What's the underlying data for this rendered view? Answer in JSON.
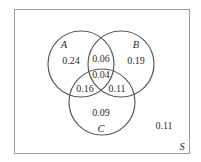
{
  "diagram": {
    "type": "venn",
    "colors": {
      "stroke": "#5a5a5a",
      "border": "#9a9a9a",
      "text": "#2a2a2a"
    },
    "universe": {
      "label": "S",
      "outside_value": "0.11"
    },
    "sets": [
      {
        "label": "A",
        "only_value": "0.24"
      },
      {
        "label": "B",
        "only_value": "0.19"
      },
      {
        "label": "C",
        "only_value": "0.09"
      }
    ],
    "intersections": {
      "A_B_only": "0.06",
      "A_C_only": "0.16",
      "B_C_only": "0.11",
      "A_B_C": "0.04"
    }
  }
}
